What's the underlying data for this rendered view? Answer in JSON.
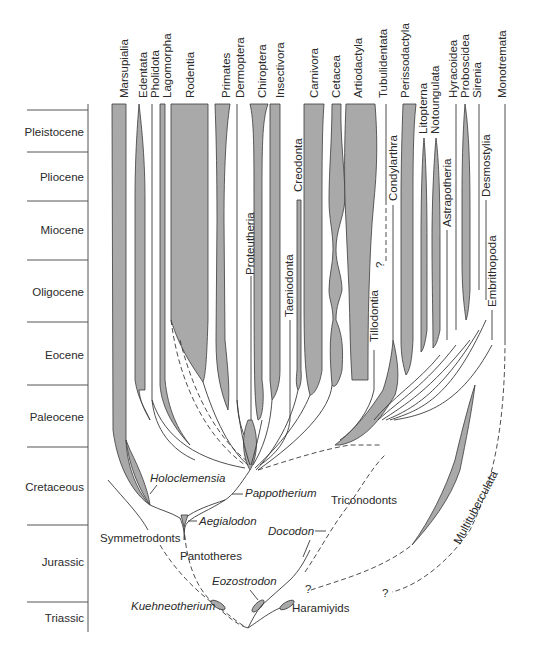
{
  "figure": {
    "periods": [
      {
        "name": "Pleistocene",
        "y_top": 110,
        "y_bot": 152
      },
      {
        "name": "Pliocene",
        "y_top": 152,
        "y_bot": 201
      },
      {
        "name": "Miocene",
        "y_top": 201,
        "y_bot": 260
      },
      {
        "name": "Oligocene",
        "y_top": 260,
        "y_bot": 322
      },
      {
        "name": "Eocene",
        "y_top": 322,
        "y_bot": 385
      },
      {
        "name": "Paleocene",
        "y_top": 385,
        "y_bot": 447
      },
      {
        "name": "Cretaceous",
        "y_top": 447,
        "y_bot": 525
      },
      {
        "name": "Jurassic",
        "y_top": 525,
        "y_bot": 602
      },
      {
        "name": "Triassic",
        "y_top": 602,
        "y_bot": 632
      }
    ],
    "top_labels": [
      {
        "name": "Marsupialia",
        "x": 124
      },
      {
        "name": "Edentata",
        "x": 143
      },
      {
        "name": "Pholidota",
        "x": 155
      },
      {
        "name": "Lagomorpha",
        "x": 167
      },
      {
        "name": "Rodentia",
        "x": 190
      },
      {
        "name": "Primates",
        "x": 226
      },
      {
        "name": "Dermoptera",
        "x": 240
      },
      {
        "name": "Chiroptera",
        "x": 262
      },
      {
        "name": "Insectivora",
        "x": 280
      },
      {
        "name": "Carnivora",
        "x": 315
      },
      {
        "name": "Cetacea",
        "x": 337
      },
      {
        "name": "Artiodactyla",
        "x": 363
      },
      {
        "name": "Tubulidentata",
        "x": 387
      },
      {
        "name": "Perissodactyla",
        "x": 409
      },
      {
        "name": "Litopterna",
        "x": 426
      },
      {
        "name": "Notoungulata",
        "x": 438
      },
      {
        "name": "Hyracoidea",
        "x": 456
      },
      {
        "name": "Proboscidea",
        "x": 468
      },
      {
        "name": "Sirenia",
        "x": 480
      },
      {
        "name": "Monotremata",
        "x": 505
      }
    ],
    "inner_labels": [
      {
        "name": "Proteutheria",
        "x": 252,
        "y": 268
      },
      {
        "name": "Creodonta",
        "x": 300,
        "y": 195
      },
      {
        "name": "Taeniodonta",
        "x": 289,
        "y": 315
      },
      {
        "name": "Tillodontia",
        "x": 377,
        "y": 340
      },
      {
        "name": "Condylarthra",
        "x": 393,
        "y": 198
      },
      {
        "name": "Astrapotheria",
        "x": 452,
        "y": 230
      },
      {
        "name": "Desmostylia",
        "x": 487,
        "y": 195
      },
      {
        "name": "Embrithopoda",
        "x": 493,
        "y": 310
      }
    ],
    "annotations": {
      "question_mark": "?",
      "holoclemensia": "Holoclemensia",
      "pappotherium": "Pappotherium",
      "aegialodon": "Aegialodon",
      "triconodonts": "Triconodonts",
      "docodon": "Docodon",
      "symmetrodonts": "Symmetrodonts",
      "pantotheres": "Pantotheres",
      "multituberculata": "Multituberculata",
      "eozostrodon": "Eozostrodon",
      "kuehneotherium": "Kuehneotherium",
      "haramiyids": "Haramiyids"
    },
    "colors": {
      "fill": "#a9a9a9",
      "stroke": "#3a3a3a",
      "text": "#2a2a2a"
    }
  }
}
